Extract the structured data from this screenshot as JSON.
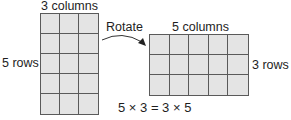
{
  "left_figure": {
    "columns_label": "3 columns",
    "rows_label": "5 rows",
    "rows": 5,
    "columns": 3
  },
  "transform": {
    "label": "Rotate",
    "icon": "curved-arrow-icon"
  },
  "right_figure": {
    "columns_label": "5 columns",
    "rows_label": "3 rows",
    "rows": 3,
    "columns": 5
  },
  "equation": "5 × 3 = 3 × 5",
  "colors": {
    "cell_fill": "#e4e4e4",
    "grid_line": "#5a5a5a",
    "text": "#1e1e1e"
  }
}
